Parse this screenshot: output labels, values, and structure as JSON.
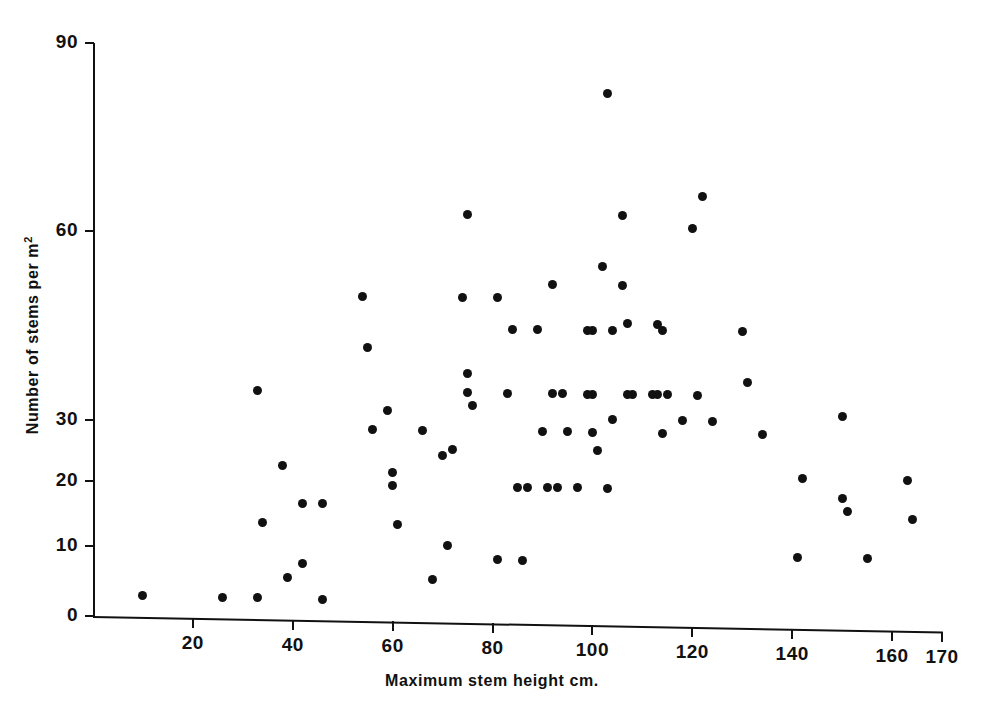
{
  "chart_data": {
    "type": "scatter",
    "title": "",
    "xlabel": "Maximum stem height cm.",
    "ylabel": "Number of stems per m",
    "ylabel_sup": "2",
    "xlim": [
      0,
      170
    ],
    "ylim": [
      0,
      90
    ],
    "grid": false,
    "legend": null,
    "marker_color": "#111111",
    "marker": "filled-circle",
    "xticks": [
      20,
      40,
      60,
      80,
      100,
      120,
      140,
      160,
      170
    ],
    "xtick_labels": [
      "20",
      "40",
      "60",
      "80",
      "100",
      "120",
      "140",
      "160",
      "170"
    ],
    "yticks": [
      0,
      10,
      20,
      30,
      60,
      90
    ],
    "ytick_labels": [
      "0",
      "10",
      "20",
      "30",
      "60",
      "90"
    ],
    "points": [
      [
        10,
        3
      ],
      [
        26,
        3
      ],
      [
        33,
        3
      ],
      [
        33,
        35
      ],
      [
        34,
        14
      ],
      [
        38,
        23
      ],
      [
        39,
        6
      ],
      [
        42,
        8
      ],
      [
        42,
        17
      ],
      [
        46,
        3
      ],
      [
        46,
        17
      ],
      [
        54,
        50
      ],
      [
        55,
        42
      ],
      [
        56,
        29
      ],
      [
        59,
        32
      ],
      [
        60,
        22
      ],
      [
        60,
        20
      ],
      [
        61,
        14
      ],
      [
        66,
        29
      ],
      [
        68,
        6
      ],
      [
        70,
        25
      ],
      [
        71,
        11
      ],
      [
        72,
        26
      ],
      [
        74,
        50
      ],
      [
        75,
        63
      ],
      [
        75,
        35
      ],
      [
        75,
        38
      ],
      [
        76,
        33
      ],
      [
        81,
        50
      ],
      [
        81,
        9
      ],
      [
        83,
        35
      ],
      [
        84,
        45
      ],
      [
        85,
        20
      ],
      [
        86,
        9
      ],
      [
        87,
        20
      ],
      [
        89,
        45
      ],
      [
        90,
        29
      ],
      [
        91,
        20
      ],
      [
        92,
        35
      ],
      [
        92,
        52
      ],
      [
        93,
        20
      ],
      [
        94,
        35
      ],
      [
        95,
        29
      ],
      [
        97,
        20
      ],
      [
        99,
        45
      ],
      [
        99,
        35
      ],
      [
        100,
        29
      ],
      [
        100,
        45
      ],
      [
        100,
        35
      ],
      [
        101,
        26
      ],
      [
        102,
        55
      ],
      [
        103,
        82
      ],
      [
        103,
        20
      ],
      [
        104,
        45
      ],
      [
        104,
        31
      ],
      [
        106,
        52
      ],
      [
        106,
        63
      ],
      [
        107,
        35
      ],
      [
        107,
        46
      ],
      [
        108,
        35
      ],
      [
        112,
        35
      ],
      [
        113,
        35
      ],
      [
        113,
        46
      ],
      [
        114,
        29
      ],
      [
        114,
        45
      ],
      [
        115,
        35
      ],
      [
        118,
        31
      ],
      [
        120,
        61
      ],
      [
        121,
        35
      ],
      [
        122,
        66
      ],
      [
        124,
        31
      ],
      [
        130,
        45
      ],
      [
        131,
        37
      ],
      [
        134,
        29
      ],
      [
        141,
        10
      ],
      [
        142,
        22
      ],
      [
        150,
        19
      ],
      [
        150,
        32
      ],
      [
        151,
        17
      ],
      [
        155,
        10
      ],
      [
        163,
        22
      ],
      [
        164,
        16
      ]
    ]
  },
  "axes": {
    "y_title_text": "Number of stems per m",
    "y_title_superscript": "2",
    "x_title_text": "Maximum stem height cm."
  }
}
